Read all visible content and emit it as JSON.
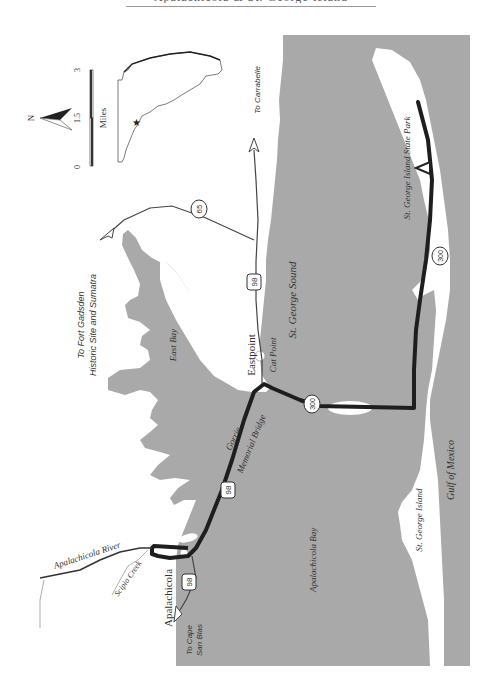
{
  "header": {
    "text": "Apalachicola & St. George Island"
  },
  "colors": {
    "water": "#a9a9a9",
    "land": "#ffffff",
    "road": "#1e1e1e",
    "thin_road": "#444444",
    "text": "#333333"
  },
  "legend": {
    "north_label": "N",
    "scale_ticks": [
      "0",
      "1.5",
      "3"
    ],
    "scale_unit": "Miles"
  },
  "labels": {
    "fort_gadsden": [
      "To Fort Gadsden",
      "Historic Site and Sumatra"
    ],
    "carrabelle": "To Carrabelle",
    "east_bay": "East Bay",
    "eastpoint": "Eastpoint",
    "cat_point": "Cat Point",
    "st_george_sound": "St. George Sound",
    "state_park": "St. George Island State Park",
    "gorrie": "Gorrie",
    "memorial_bridge": "Memorial Bridge",
    "apalachicola_bay": "Apalachicola Bay",
    "st_george_island": "St. George Island",
    "gulf": "Gulf of Mexico",
    "apalachicola_river": "Apalachicola River",
    "scipio_creek": "Scipio Creek",
    "apalachicola": "Apalachicola",
    "cape_san_blas": [
      "To Cape",
      "San Blas"
    ]
  },
  "shields": {
    "sr65": "65",
    "us98_a": "98",
    "us98_b": "98",
    "us98_c": "98",
    "sr300_a": "300",
    "sr300_b": "300"
  }
}
